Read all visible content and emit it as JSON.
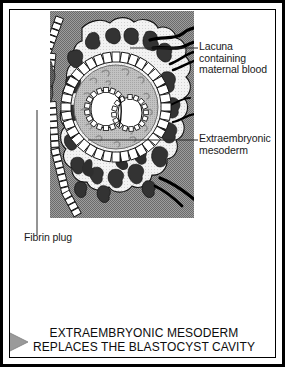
{
  "figure": {
    "width": 285,
    "height": 367,
    "background_color": "#ffffff",
    "border_color": "#000000"
  },
  "caption": {
    "line1": "EXTRAEMBRYONIC MESODERM",
    "line2": "REPLACES THE BLASTOCYST CAVITY",
    "text": "EXTRAEMBRYONIC MESODERM\nREPLACES THE BLASTOCYST CAVITY",
    "arrow_color": "#9a9a9a"
  },
  "labels": {
    "lacuna": {
      "line1": "Lacuna",
      "line2": "containing",
      "line3": "maternal blood",
      "text": "Lacuna\ncontaining\nmaternal blood"
    },
    "mesoderm": {
      "line1": "Extraembryonic",
      "line2": "mesoderm",
      "text": "Extraembryonic\nmesoderm"
    },
    "fibrin": {
      "text": "Fibrin plug"
    }
  },
  "diagram": {
    "panel": {
      "x": 40,
      "y": 1,
      "width": 144,
      "height": 207
    },
    "colors": {
      "endometrium_gray": "#8d8d8d",
      "trophoblast_light": "#efefef",
      "lacuna_dark": "#3b3b3b",
      "mesoderm_gray": "#b6b6b6",
      "cell_fill": "#ffffff",
      "outline_black": "#000000",
      "fibrin_plug": "#585858",
      "vessel_black": "#000000",
      "leader_line": "#2b2b2b"
    },
    "structures": [
      "uterine-endometrium-background",
      "syncytiotrophoblast-mass",
      "lacunae-maternal-blood",
      "maternal-blood-vessels",
      "uterine-epithelium-cell-row",
      "fibrin-plug",
      "cytotrophoblast-cell-ring",
      "extraembryonic-mesoderm",
      "amniotic-cavity",
      "yolk-sac",
      "bilaminar-embryonic-disc"
    ]
  }
}
